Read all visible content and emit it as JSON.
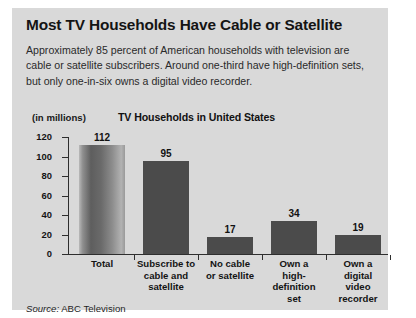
{
  "headline": "Most TV Households Have Cable or Satellite",
  "deck": "Approximately 85 percent of American households with television are cable or satellite subscribers. Around one-third have high-definition sets, but only one-in-six owns a digital video recorder.",
  "units_label": "(in millions)",
  "source": {
    "word": "Source:",
    "text": "ABC Television"
  },
  "colors": {
    "card_background": "#d9d9d9",
    "bar_solid": "#4b4b4b",
    "axis": "#2e2e2e",
    "text": "#141414"
  },
  "chart_data": {
    "type": "bar",
    "title": "TV Households in United States",
    "xlabel": "",
    "ylabel": "(in millions)",
    "ylim": [
      0,
      120
    ],
    "yticks": [
      0,
      20,
      40,
      60,
      80,
      100,
      120
    ],
    "ytick_labels": [
      "0",
      "20",
      "40",
      "60",
      "80",
      "100",
      "120"
    ],
    "grid": false,
    "legend": "none",
    "categories": [
      "Total",
      "Subscribe to cable and satellite",
      "No cable or satellite",
      "Own a high-definition set",
      "Own a digital video recorder"
    ],
    "category_lines": [
      [
        "Total"
      ],
      [
        "Subscribe to",
        "cable and",
        "satellite"
      ],
      [
        "No cable",
        "or satellite"
      ],
      [
        "Own a",
        "high-definition",
        "set"
      ],
      [
        "Own a",
        "digital",
        "video",
        "recorder"
      ]
    ],
    "values": [
      112,
      95,
      17,
      34,
      19
    ],
    "value_labels": [
      "112",
      "95",
      "17",
      "34",
      "19"
    ],
    "bar_styles": [
      "gradient",
      "solid",
      "solid",
      "solid",
      "solid"
    ]
  }
}
